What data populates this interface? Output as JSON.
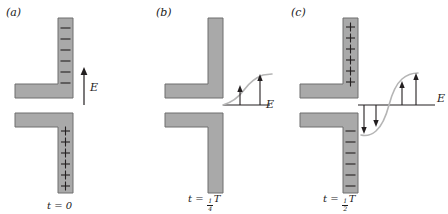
{
  "figure": {
    "type": "antenna-radiation-sequence",
    "colors": {
      "bar_fill": "#a9a9a9",
      "bar_stroke": "#6e6e6e",
      "line": "#231f20",
      "wave": "#b5b5b5",
      "background": "#ffffff"
    }
  },
  "panels": [
    {
      "id": "a",
      "label": "(a)",
      "time_label": {
        "prefix": "t = ",
        "value": "0",
        "numerator": "",
        "denominator": "",
        "suffix": ""
      },
      "top_rod_charge": "−",
      "top_rod_charge_name": "minus-sign",
      "top_rod_charge_count": 6,
      "bottom_rod_charge": "+",
      "bottom_rod_charge_name": "plus-sign",
      "bottom_rod_charge_count": 6,
      "field_label": "E",
      "wave": "none",
      "arrows": [
        {
          "direction": "up",
          "magnitude": 1.0
        }
      ]
    },
    {
      "id": "b",
      "label": "(b)",
      "time_label": {
        "prefix": "t = ",
        "value": "",
        "numerator": "1",
        "denominator": "4",
        "suffix": "T"
      },
      "top_rod_charge": "",
      "top_rod_charge_name": "no-charge",
      "top_rod_charge_count": 0,
      "bottom_rod_charge": "",
      "bottom_rod_charge_name": "no-charge",
      "bottom_rod_charge_count": 0,
      "field_label": "E",
      "wave": "quarter-sine-rising",
      "arrows": [
        {
          "direction": "up",
          "magnitude": 0.55
        },
        {
          "direction": "up",
          "magnitude": 1.0
        }
      ]
    },
    {
      "id": "c",
      "label": "(c)",
      "time_label": {
        "prefix": "t = ",
        "value": "",
        "numerator": "1",
        "denominator": "2",
        "suffix": "T"
      },
      "top_rod_charge": "+",
      "top_rod_charge_name": "plus-sign",
      "top_rod_charge_count": 6,
      "bottom_rod_charge": "−",
      "bottom_rod_charge_name": "minus-sign",
      "bottom_rod_charge_count": 6,
      "field_label": "E",
      "wave": "half-sine-s-curve",
      "arrows": [
        {
          "direction": "down",
          "magnitude": 1.0
        },
        {
          "direction": "down",
          "magnitude": 0.62
        },
        {
          "direction": "up",
          "magnitude": 0.62
        },
        {
          "direction": "up",
          "magnitude": 1.0
        }
      ]
    }
  ]
}
